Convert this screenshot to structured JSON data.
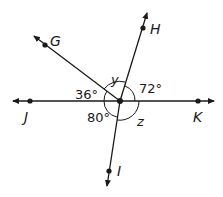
{
  "diagram": {
    "type": "angles-at-point",
    "center": {
      "x": 120,
      "y": 101
    },
    "points": [
      {
        "name": "G",
        "label": "G",
        "x": 45,
        "y": 45
      },
      {
        "name": "H",
        "label": "H",
        "x": 143,
        "y": 28
      },
      {
        "name": "J",
        "label": "J",
        "x": 30,
        "y": 101
      },
      {
        "name": "K",
        "label": "K",
        "x": 198,
        "y": 101
      },
      {
        "name": "I",
        "label": "I",
        "x": 109,
        "y": 171
      }
    ],
    "angles": {
      "jg": "36°",
      "hk": "72°",
      "ji": "80°",
      "gh": "y",
      "ik": "z"
    },
    "colors": {
      "stroke": "#1a1a1a",
      "background": "#ffffff"
    }
  }
}
